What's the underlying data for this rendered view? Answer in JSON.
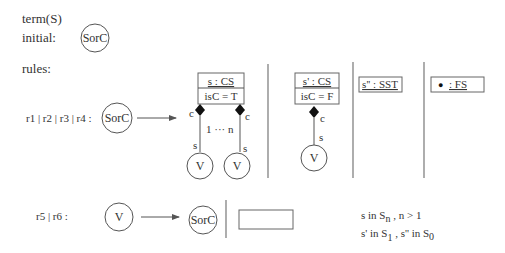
{
  "header": {
    "term_label": "term(S)",
    "initial_label": "initial:",
    "initial_node": "SorC",
    "rules_label": "rules:"
  },
  "rule1": {
    "label": "r1 | r2 | r3 | r4 :",
    "lhs_node": "SorC",
    "panel1": {
      "object_name": "s : CS",
      "attribute": "isC = T",
      "left_role_c": "c",
      "right_role_c": "c",
      "left_role_s": "s",
      "right_role_s": "s",
      "multiplicity": "1 ··· n",
      "left_child": "V",
      "right_child": "V"
    },
    "panel2": {
      "object_name": "s' : CS",
      "attribute": "isC = F",
      "role_c": "c",
      "role_s": "s",
      "child": "V"
    },
    "panel3": {
      "object_name": "s'' : SST"
    },
    "panel4": {
      "object_name": ": FS",
      "bullet": "●"
    }
  },
  "rule2": {
    "label": "r5 | r6 :",
    "lhs_node": "V",
    "rhs_node": "SorC"
  },
  "constraints": {
    "line1": {
      "a": "s  in S",
      "sub": "n",
      "b": " , n > 1"
    },
    "line2": {
      "a": "s'  in  S",
      "sub1": "1",
      "b": " , s'' in S",
      "sub2": "0"
    }
  }
}
